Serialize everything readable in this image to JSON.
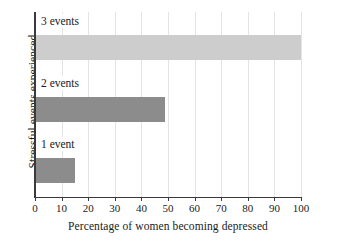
{
  "chart_data": {
    "type": "bar",
    "orientation": "horizontal",
    "title": "",
    "xlabel": "Percentage of women becoming depressed",
    "ylabel": "Stressful events experienced",
    "categories": [
      "1 event",
      "2 events",
      "3 events"
    ],
    "values": [
      15,
      49,
      100
    ],
    "series": [
      {
        "name": "Percentage of women becoming depressed",
        "values": [
          15,
          49,
          100
        ]
      }
    ],
    "bar_colors": [
      "#8c8c8c",
      "#8c8c8c",
      "#cdcdcd"
    ],
    "xlim": [
      0,
      100
    ],
    "xticks": [
      0,
      10,
      20,
      30,
      40,
      50,
      60,
      70,
      80,
      90,
      100
    ],
    "xtick_labels": [
      "0",
      "10",
      "20",
      "30",
      "40",
      "50",
      "60",
      "70",
      "80",
      "90",
      "100"
    ],
    "grid": "vertical",
    "legend": "none",
    "axis_color": "#3a3a3a",
    "grid_color": "#e4e4e4",
    "background": "#ffffff"
  },
  "bars": [
    {
      "label": "3 events",
      "value": 100,
      "color": "#cdcdcd"
    },
    {
      "label": "2 events",
      "value": 49,
      "color": "#8c8c8c"
    },
    {
      "label": "1 event",
      "value": 15,
      "color": "#8c8c8c"
    }
  ],
  "xticks": [
    {
      "label": "0",
      "value": 0
    },
    {
      "label": "10",
      "value": 10
    },
    {
      "label": "20",
      "value": 20
    },
    {
      "label": "30",
      "value": 30
    },
    {
      "label": "40",
      "value": 40
    },
    {
      "label": "50",
      "value": 50
    },
    {
      "label": "60",
      "value": 60
    },
    {
      "label": "70",
      "value": 70
    },
    {
      "label": "80",
      "value": 80
    },
    {
      "label": "90",
      "value": 90
    },
    {
      "label": "100",
      "value": 100
    }
  ],
  "axes": {
    "x_title": "Percentage of women becoming depressed",
    "y_title": "Stressful events experienced"
  }
}
